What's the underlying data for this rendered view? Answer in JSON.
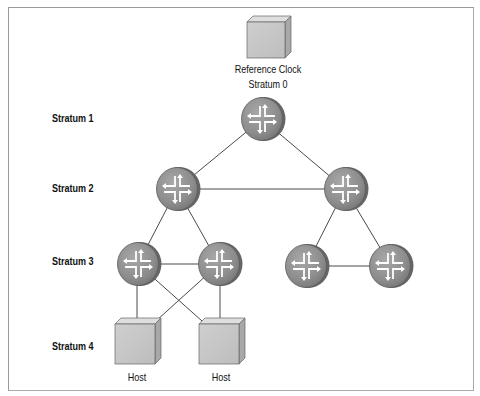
{
  "diagram": {
    "type": "ntp-stratum-hierarchy",
    "colors": {
      "frame_border": "#9a9a9a",
      "link_line": "#444444",
      "router_fill": "#8e8e8e",
      "router_edge": "#5e5e5e",
      "box_front": "#c9c9c9",
      "box_top": "#dcdcdc",
      "box_side": "#a9a9a9"
    },
    "stratum_labels": [
      {
        "id": "stratum-1",
        "text": "Stratum 1"
      },
      {
        "id": "stratum-2",
        "text": "Stratum 2"
      },
      {
        "id": "stratum-3",
        "text": "Stratum 3"
      },
      {
        "id": "stratum-4",
        "text": "Stratum 4"
      }
    ],
    "reference_clock": {
      "line1": "Reference Clock",
      "line2": "Stratum 0"
    },
    "nodes": [
      {
        "id": "s1",
        "kind": "router",
        "stratum": 1
      },
      {
        "id": "s2a",
        "kind": "router",
        "stratum": 2
      },
      {
        "id": "s2b",
        "kind": "router",
        "stratum": 2
      },
      {
        "id": "s3a",
        "kind": "router",
        "stratum": 3
      },
      {
        "id": "s3b",
        "kind": "router",
        "stratum": 3
      },
      {
        "id": "s3c",
        "kind": "router",
        "stratum": 3
      },
      {
        "id": "s3d",
        "kind": "router",
        "stratum": 3
      },
      {
        "id": "h1",
        "kind": "host",
        "stratum": 4,
        "label": "Host"
      },
      {
        "id": "h2",
        "kind": "host",
        "stratum": 4,
        "label": "Host"
      }
    ],
    "edges": [
      [
        "s1",
        "s2a"
      ],
      [
        "s1",
        "s2b"
      ],
      [
        "s2a",
        "s2b"
      ],
      [
        "s2a",
        "s3a"
      ],
      [
        "s2a",
        "s3b"
      ],
      [
        "s3a",
        "s3b"
      ],
      [
        "s2b",
        "s3c"
      ],
      [
        "s2b",
        "s3d"
      ],
      [
        "s3c",
        "s3d"
      ],
      [
        "s3a",
        "h1"
      ],
      [
        "s3a",
        "h2"
      ],
      [
        "s3b",
        "h1"
      ],
      [
        "s3b",
        "h2"
      ]
    ],
    "hosts": [
      {
        "label": "Host"
      },
      {
        "label": "Host"
      }
    ]
  }
}
